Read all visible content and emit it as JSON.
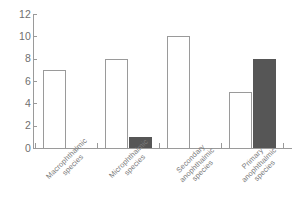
{
  "chart_data": {
    "type": "bar",
    "title": "",
    "subtitle": "",
    "xlabel": "",
    "ylabel": "",
    "ylim": [
      0,
      12
    ],
    "ytick_values": [
      0,
      2,
      4,
      6,
      8,
      10,
      12
    ],
    "ytick_labels": [
      "0",
      "2",
      "4",
      "6",
      "8",
      "10",
      "12"
    ],
    "grid": false,
    "legend": false,
    "legend_position": "none",
    "category_label_rotation": -45,
    "categories": [
      "Macrophthalmic\nspecies",
      "Microphthalmic\nspecies",
      "Secondary\nanophthalmic\nspecies",
      "Primary\nanophthalmic\nspecies"
    ],
    "categories_flat": [
      "Macrophthalmic species",
      "Microphthalmic species",
      "Secondary anophthalmic species",
      "Primary anophthalmic species"
    ],
    "series": [
      {
        "name": "open",
        "fill": "#ffffff",
        "edge": "#9a9a9a",
        "values": [
          7,
          8,
          10,
          5
        ]
      },
      {
        "name": "filled",
        "fill": "#565656",
        "edge": "#565656",
        "values": [
          0,
          1,
          0,
          8
        ]
      }
    ]
  },
  "axes": {
    "axis_color": "#9a9a9a",
    "tick_color": "#9a9a9a",
    "label_color": "#6f6f6f"
  }
}
